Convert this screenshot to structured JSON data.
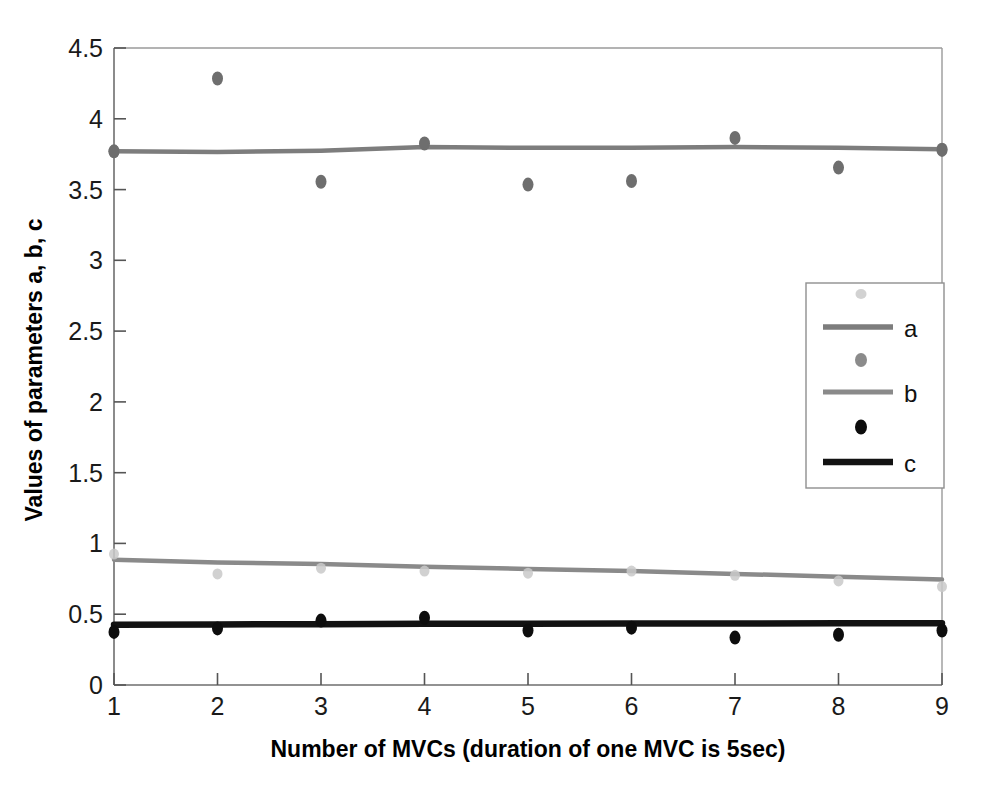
{
  "chart_data": {
    "type": "scatter",
    "title": "",
    "xlabel": "Number of MVCs (duration of one MVC is 5sec)",
    "ylabel": "Values of parameters a, b, c",
    "x": [
      1,
      2,
      3,
      4,
      5,
      6,
      7,
      8,
      9
    ],
    "xlim": [
      1,
      9
    ],
    "ylim": [
      0,
      4.5
    ],
    "xticks": [
      "1",
      "2",
      "3",
      "4",
      "5",
      "6",
      "7",
      "8",
      "9"
    ],
    "yticks": [
      "0",
      "0.5",
      "1",
      "1.5",
      "2",
      "2.5",
      "3",
      "3.5",
      "4",
      "4.5"
    ],
    "grid": false,
    "legend_position": "right-center",
    "series": [
      {
        "name": "a",
        "role": "fit-line",
        "style": "line",
        "color": "#7d7d7d",
        "values": [
          3.77,
          3.765,
          3.775,
          3.8,
          3.795,
          3.795,
          3.8,
          3.795,
          3.785
        ]
      },
      {
        "name": "a",
        "role": "data-points",
        "style": "marker",
        "color": "#6e6e6e",
        "values": [
          3.77,
          4.285,
          3.555,
          3.825,
          3.535,
          3.56,
          3.865,
          3.655,
          3.78
        ]
      },
      {
        "name": "b",
        "role": "fit-line",
        "style": "line",
        "color": "#8a8a8a",
        "values": [
          0.885,
          0.865,
          0.855,
          0.835,
          0.82,
          0.805,
          0.785,
          0.765,
          0.745
        ]
      },
      {
        "name": "b",
        "role": "data-points",
        "style": "faint-marker",
        "color": "#c9c9c9",
        "values": [
          0.925,
          0.785,
          0.825,
          0.805,
          0.79,
          0.805,
          0.775,
          0.735,
          0.695
        ]
      },
      {
        "name": "c",
        "role": "fit-line",
        "style": "thick-line",
        "color": "#121212",
        "values": [
          0.425,
          0.428,
          0.43,
          0.432,
          0.433,
          0.434,
          0.435,
          0.436,
          0.437
        ]
      },
      {
        "name": "c",
        "role": "data-points",
        "style": "marker",
        "color": "#0d0d0d",
        "values": [
          0.375,
          0.4,
          0.455,
          0.475,
          0.385,
          0.405,
          0.335,
          0.355,
          0.385
        ]
      }
    ]
  },
  "axes": {
    "y_title": "Values of parameters a, b, c",
    "x_title": "Number of MVCs (duration of one MVC is 5sec)",
    "y_ticks": [
      "4.5",
      "4",
      "3.5",
      "3",
      "2.5",
      "2",
      "1.5",
      "1",
      "0.5",
      "0"
    ],
    "x_ticks": [
      "1",
      "2",
      "3",
      "4",
      "5",
      "6",
      "7",
      "8",
      "9"
    ]
  },
  "legend": {
    "entries": [
      {
        "label": "",
        "kind": "faint-marker"
      },
      {
        "label": "a",
        "kind": "line"
      },
      {
        "label": "a-points",
        "kind": "gray-marker"
      },
      {
        "label": "b",
        "kind": "line"
      },
      {
        "label": "b-points",
        "kind": "black-marker"
      },
      {
        "label": "c",
        "kind": "thick-line"
      }
    ],
    "visible_labels": [
      "a",
      "b",
      "c"
    ]
  },
  "colors": {
    "axis": "#8d8d8d",
    "gray_line": "#7d7d7d",
    "gray_marker": "#6e6e6e",
    "faint_marker": "#c9c9c9",
    "black_line": "#121212",
    "black_marker": "#0d0d0d",
    "text": "#111111",
    "background": "#ffffff"
  }
}
